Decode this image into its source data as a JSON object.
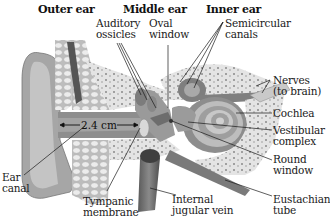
{
  "diagram": {
    "type": "anatomical-cross-section",
    "section_headers": [
      {
        "id": "outer",
        "label": "Outer ear"
      },
      {
        "id": "middle",
        "label": "Middle ear"
      },
      {
        "id": "inner",
        "label": "Inner ear"
      }
    ],
    "labels": {
      "auditory_ossicles": {
        "line1": "Auditory",
        "line2": "ossicles"
      },
      "oval_window": {
        "line1": "Oval",
        "line2": "window"
      },
      "semicircular_canals": {
        "line1": "Semicircular",
        "line2": "canals"
      },
      "nerves": {
        "line1": "Nerves",
        "line2": "(to brain)"
      },
      "cochlea": {
        "line1": "Cochlea"
      },
      "vestibular_complex": {
        "line1": "Vestibular",
        "line2": "complex"
      },
      "round_window": {
        "line1": "Round",
        "line2": "window"
      },
      "eustachian_tube": {
        "line1": "Eustachian",
        "line2": "tube"
      },
      "internal_jugular_vein": {
        "line1": "Internal",
        "line2": "jugular vein"
      },
      "tympanic_membrane": {
        "line1": "Tympanic",
        "line2": "membrane"
      },
      "ear_canal": {
        "line1": "Ear",
        "line2": "canal"
      }
    },
    "measurement": {
      "label": "2.4 cm"
    },
    "colors": {
      "background": "#ffffff",
      "tissue_light": "#c9c9c9",
      "tissue_mid": "#9a9a9a",
      "tissue_dark": "#6e6e6e",
      "bone": "#e2e2e2",
      "leader_line": "#1a1a1a"
    }
  }
}
